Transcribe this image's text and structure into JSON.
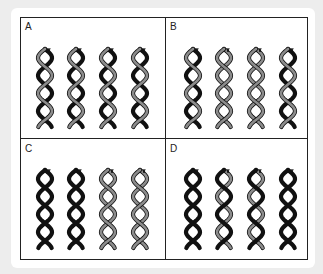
{
  "figure": {
    "type": "dna-replication-models",
    "colors": {
      "black_strand": "#111111",
      "gray_strand": "#8c8c8c",
      "outline": "#111111",
      "frame": "#222222",
      "background": "#ededed",
      "card": "#ffffff"
    },
    "panels": [
      {
        "label": "A",
        "helices": [
          [
            "black",
            "gray"
          ],
          [
            "black",
            "gray"
          ],
          [
            "black",
            "gray"
          ],
          [
            "black",
            "gray"
          ]
        ]
      },
      {
        "label": "B",
        "helices": [
          [
            "black",
            "gray"
          ],
          [
            "gray",
            "gray"
          ],
          [
            "gray",
            "gray"
          ],
          [
            "black",
            "gray"
          ]
        ]
      },
      {
        "label": "C",
        "helices": [
          [
            "black",
            "black"
          ],
          [
            "black",
            "black"
          ],
          [
            "gray",
            "gray"
          ],
          [
            "gray",
            "gray"
          ]
        ]
      },
      {
        "label": "D",
        "helices": [
          [
            "black",
            "black"
          ],
          [
            "gray",
            "black"
          ],
          [
            "gray",
            "black"
          ],
          [
            "black",
            "black"
          ]
        ]
      }
    ]
  }
}
